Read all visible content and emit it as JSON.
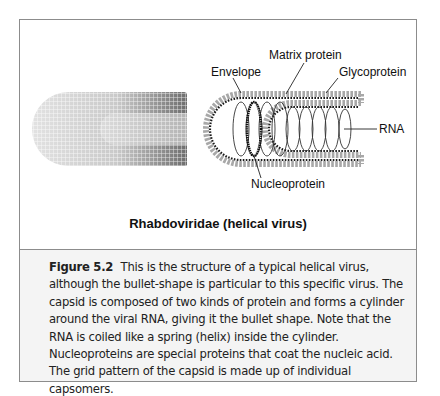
{
  "diagram": {
    "labels": {
      "matrix_protein": "Matrix protein",
      "envelope": "Envelope",
      "glycoprotein": "Glycoprotein",
      "rna": "RNA",
      "nucleoprotein": "Nucleoprotein"
    },
    "title": "Rhabdoviridae (helical virus)"
  },
  "caption": {
    "figure_label": "Figure 5.2",
    "text": "This is the structure of a typical helical virus, although the bullet-shape is particular to this specific virus. The capsid is composed of two kinds of protein and forms a cylinder around the viral RNA, giving it the bullet shape. Note that the RNA is coiled like a spring (helix) inside the cylinder. Nucleoproteins are special proteins that coat the nucleic acid. The grid pattern of the capsid is made up of individual capsomers."
  },
  "colors": {
    "border": "#8c8c8c",
    "caption_bg": "#f4f4f4",
    "glycoprotein_dots": "#a8a8a8",
    "matrix_dots": "#1a1a1a"
  }
}
